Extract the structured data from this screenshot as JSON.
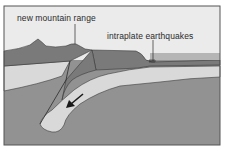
{
  "diagram": {
    "labels": {
      "mountain": "new mountain range",
      "earthquakes": "intraplate earthquakes"
    },
    "colors": {
      "sky": "#ebebeb",
      "crust": "#7a7a7a",
      "lithosphere": "#d9d9d9",
      "mantle": "#929292",
      "frame": "#555555",
      "outline": "#3a3a3a"
    },
    "icons": {
      "motion-arrow": "arrow pointing down-left along subducting slab"
    }
  }
}
